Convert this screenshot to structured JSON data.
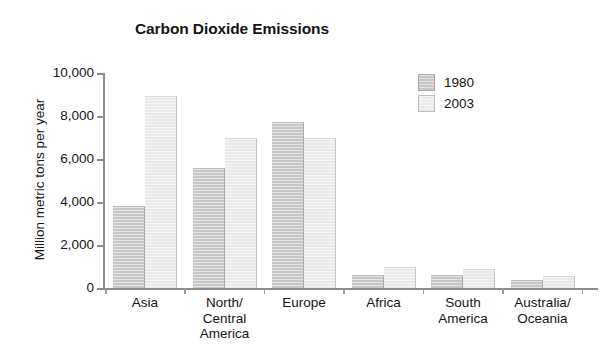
{
  "chart_data": {
    "type": "bar",
    "title": "Carbon Dioxide Emissions",
    "xlabel": "",
    "ylabel": "Million metric tons per year",
    "ylim": [
      0,
      10000
    ],
    "ytick_labels": [
      "10,000",
      "8,000",
      "6,000",
      "4,000",
      "2,000",
      "0"
    ],
    "ytick_values": [
      10000,
      8000,
      6000,
      4000,
      2000,
      0
    ],
    "grid": false,
    "legend_position": "upper-right",
    "categories": [
      "Asia",
      "North/\nCentral\nAmerica",
      "Europe",
      "Africa",
      "South\nAmerica",
      "Australia/\nOceania"
    ],
    "category_lines": [
      [
        "Asia"
      ],
      [
        "North/",
        "Central",
        "America"
      ],
      [
        "Europe"
      ],
      [
        "Africa"
      ],
      [
        "South",
        "America"
      ],
      [
        "Australia/",
        "Oceania"
      ]
    ],
    "series": [
      {
        "name": "1980",
        "color": "#c6c6c6",
        "values": [
          3800,
          5600,
          7700,
          600,
          600,
          350
        ]
      },
      {
        "name": "2003",
        "color": "#e9e9e9",
        "values": [
          8950,
          7000,
          7000,
          1000,
          900,
          550
        ]
      }
    ]
  },
  "legend": {
    "entries": [
      {
        "label": "1980"
      },
      {
        "label": "2003"
      }
    ]
  }
}
